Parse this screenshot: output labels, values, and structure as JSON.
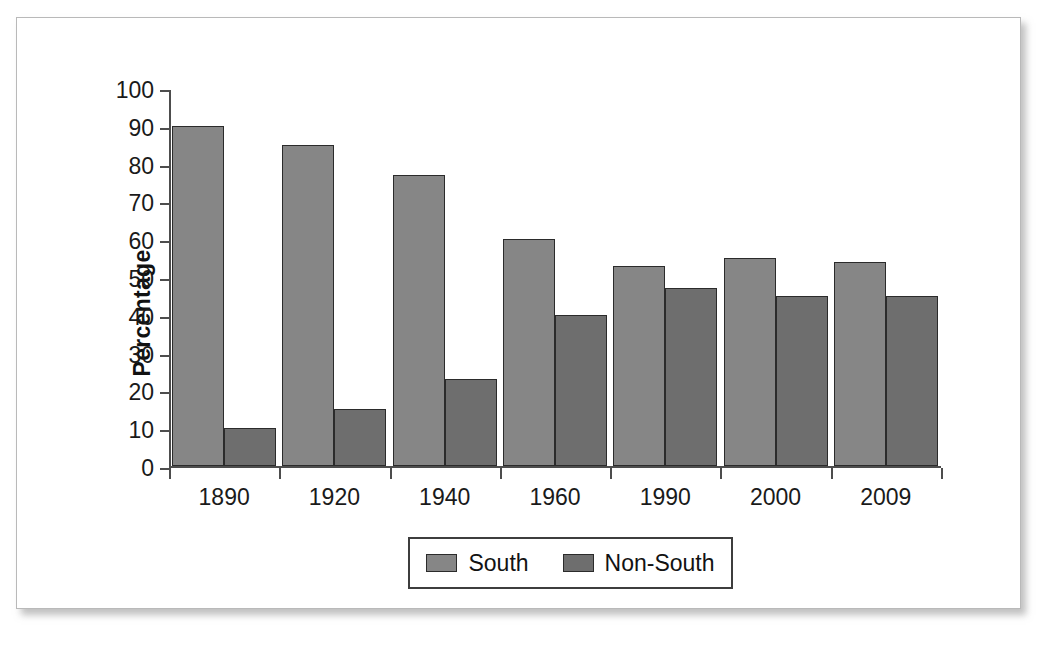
{
  "chart_data": {
    "type": "bar",
    "title": "",
    "subtitle": "",
    "xlabel": "",
    "ylabel": "Percentage",
    "ylim": [
      0,
      100
    ],
    "ytick_step": 10,
    "yticks": [
      100,
      90,
      80,
      70,
      60,
      50,
      40,
      30,
      20,
      10,
      0
    ],
    "grid": false,
    "legend_position": "bottom-center",
    "categories": [
      "1890",
      "1920",
      "1940",
      "1960",
      "1990",
      "2000",
      "2009"
    ],
    "series": [
      {
        "name": "South",
        "color": "#868686",
        "values": [
          90,
          85,
          77,
          60,
          53,
          55,
          54
        ]
      },
      {
        "name": "Non-South",
        "color": "#6e6e6e",
        "values": [
          10,
          15,
          23,
          40,
          47,
          45,
          45
        ]
      }
    ],
    "annotations": []
  },
  "figure": {
    "background_color": "#ffffff",
    "border_color": "#b9b9b9",
    "axis_color": "#4d4d4d",
    "bar_outline_color": "#2b2b2b"
  }
}
